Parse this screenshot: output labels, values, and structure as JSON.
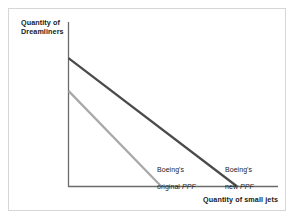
{
  "figure": {
    "background_color": "#ffffff",
    "border_color": "#d6d6d6"
  },
  "axes": {
    "y_title": "Quantity of\nDreamliners",
    "x_title": "Quantity of small jets",
    "axis_color": "#6b6b6b"
  },
  "labels": {
    "original": {
      "line1": "Boeing's",
      "line2_prefix": "original ",
      "line2_italic": "PPF"
    },
    "new": {
      "line1": "Boeing's",
      "line2_prefix": "new ",
      "line2_italic": "PPF"
    }
  },
  "chart_data": {
    "type": "line",
    "title": "",
    "xlabel": "Quantity of small jets",
    "ylabel": "Quantity of Dreamliners",
    "grid": false,
    "legend_position": "inline-annotations",
    "xlim": [
      0,
      100
    ],
    "ylim": [
      0,
      100
    ],
    "series": [
      {
        "name": "Boeing's original PPF",
        "color": "#a8a8a8",
        "linewidth": 2.2,
        "x": [
          0,
          44
        ],
        "y": [
          58,
          0
        ],
        "annotation": "Boeing's original PPF"
      },
      {
        "name": "Boeing's new PPF",
        "color": "#4a4a4a",
        "linewidth": 2.2,
        "x": [
          0,
          80
        ],
        "y": [
          78,
          0
        ],
        "annotation": "Boeing's new PPF"
      }
    ]
  }
}
